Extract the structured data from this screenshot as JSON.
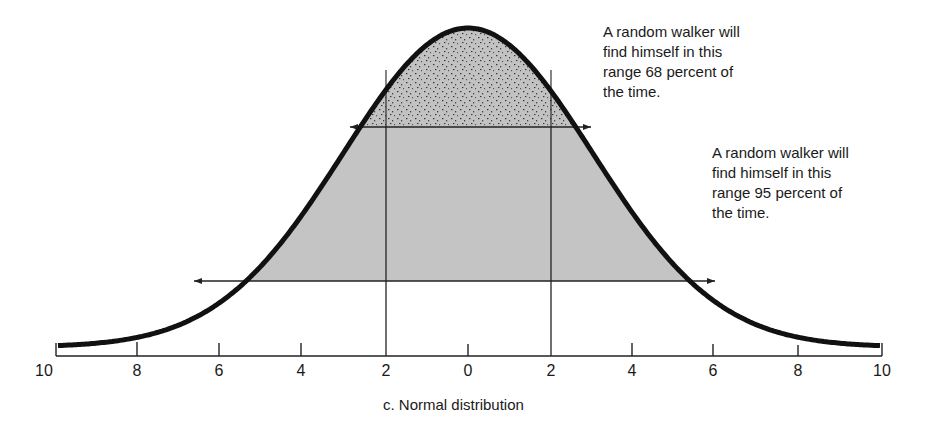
{
  "chart_data": {
    "type": "area",
    "title": "c. Normal distribution",
    "xlabel": "",
    "ylabel": "",
    "x_ticks": [
      "10",
      "8",
      "6",
      "4",
      "2",
      "0",
      "2",
      "4",
      "6",
      "8",
      "10"
    ],
    "x_values": [
      -10,
      -8,
      -6,
      -4,
      -2,
      0,
      2,
      4,
      6,
      8,
      10
    ],
    "xlim": [
      -10,
      10
    ],
    "grid": false,
    "legend": null,
    "curve": "normal density, mean 0, sd approx 3",
    "vertical_lines_at": [
      -2,
      2
    ],
    "ranges": [
      {
        "label": "68 percent range",
        "from": -3,
        "to": 3,
        "shading": "stippled"
      },
      {
        "label": "95 percent range",
        "from": -6,
        "to": 6,
        "shading": "gray"
      }
    ],
    "annotations": [
      "A random walker will find himself in this range 68 percent of the time.",
      "A random walker will find himself in this range 95 percent of the time."
    ]
  },
  "annotation_68": {
    "lines": [
      "A random walker will",
      "find himself in this",
      "range 68 percent of",
      "the time."
    ]
  },
  "annotation_95": {
    "lines": [
      "A random walker will",
      "find himself in this",
      "range 95 percent of",
      "the time."
    ]
  },
  "axis": {
    "ticks": [
      "10",
      "8",
      "6",
      "4",
      "2",
      "0",
      "2",
      "4",
      "6",
      "8",
      "10"
    ]
  },
  "caption": "c. Normal distribution",
  "colors": {
    "curve": "#111111",
    "fill_95": "#c4c4c4",
    "fill_68": "#bdbdbd",
    "stipple": "#3a3a3a"
  }
}
